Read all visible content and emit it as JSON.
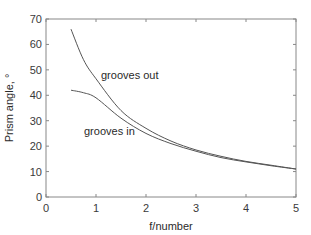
{
  "chart_data": {
    "type": "line",
    "title": "",
    "xlabel": "f/number",
    "ylabel": "Prism angle, °",
    "xlim": [
      0,
      5
    ],
    "ylim": [
      0,
      70
    ],
    "xticks": [
      0,
      1,
      2,
      3,
      4,
      5
    ],
    "yticks": [
      0,
      10,
      20,
      30,
      40,
      50,
      60,
      70
    ],
    "grid": false,
    "legend": "none (inline annotations)",
    "series": [
      {
        "name": "grooves out",
        "x": [
          0.5,
          0.75,
          1.0,
          1.5,
          2.0,
          2.5,
          3.0,
          3.5,
          4.0,
          4.5,
          5.0
        ],
        "y": [
          66,
          54,
          46.5,
          34,
          27,
          22,
          18.5,
          16,
          14,
          12.5,
          11
        ]
      },
      {
        "name": "grooves in",
        "x": [
          0.5,
          0.75,
          1.0,
          1.5,
          2.0,
          2.5,
          3.0,
          3.5,
          4.0,
          4.5,
          5.0
        ],
        "y": [
          42,
          41,
          39,
          31,
          25,
          21,
          18,
          15.5,
          13.8,
          12.3,
          11
        ]
      }
    ],
    "annotations": [
      {
        "text": "grooves out",
        "x": 1.1,
        "y": 48
      },
      {
        "text": "grooves in",
        "x": 0.76,
        "y": 24.5
      }
    ]
  },
  "colors": {
    "line": "#555555",
    "axis": "#777777",
    "text": "#2a2a2a"
  }
}
